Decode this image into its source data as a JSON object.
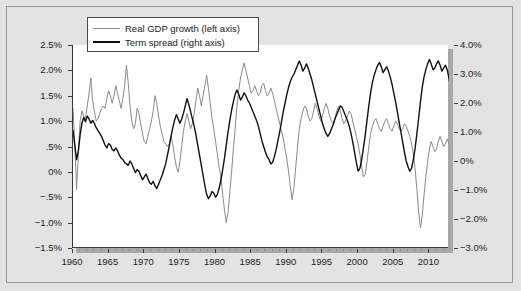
{
  "chart_data": {
    "type": "line",
    "title": "",
    "subtitle": "",
    "xlabel": "",
    "ylabel": "",
    "grid": false,
    "legend_position": "top-left",
    "x_axis": {
      "min": 1960,
      "max": 2012.75,
      "major_ticks": [
        1960,
        1965,
        1970,
        1975,
        1980,
        1985,
        1990,
        1995,
        2000,
        2005,
        2010
      ],
      "tick_labels": [
        "1960",
        "1965",
        "1970",
        "1975",
        "1980",
        "1985",
        "1990",
        "1995",
        "2000",
        "2005",
        "2010"
      ],
      "minor_tick_interval": 1
    },
    "y_axis_left": {
      "label": "Real GDP growth",
      "min": -1.5,
      "max": 2.5,
      "ticks": [
        2.5,
        2.0,
        1.5,
        1.0,
        0.5,
        0.0,
        -0.5,
        -1.0,
        -1.5
      ],
      "tick_labels": [
        "2.5%",
        "2.0%",
        "1.5%",
        "1.0%",
        ".5%",
        "0%",
        "−.5%",
        "−1.0%",
        "−1.5%"
      ]
    },
    "y_axis_right": {
      "label": "Term spread",
      "min": -3.0,
      "max": 4.0,
      "ticks": [
        4.0,
        3.0,
        2.0,
        1.0,
        0.0,
        -1.0,
        -2.0,
        -3.0
      ],
      "tick_labels": [
        "4.0%",
        "3.0%",
        "2.0%",
        "1.0%",
        "0%",
        "−1.0%",
        "−2.0%",
        "−3.0%"
      ]
    },
    "series": [
      {
        "name": "Real GDP growth (left axis)",
        "axis": "left",
        "color": "#8a8a8a",
        "width": 1,
        "x_start": 1960.0,
        "x_step": 0.25,
        "values": [
          1.25,
          0.55,
          -0.35,
          0.35,
          1.0,
          1.2,
          1.1,
          1.05,
          1.3,
          1.55,
          1.85,
          1.4,
          1.2,
          1.0,
          1.05,
          1.15,
          1.25,
          1.3,
          1.25,
          1.45,
          1.6,
          1.5,
          1.35,
          1.5,
          1.7,
          1.55,
          1.4,
          1.25,
          1.45,
          1.7,
          2.1,
          1.75,
          1.3,
          1.0,
          0.85,
          0.95,
          1.25,
          1.15,
          0.95,
          0.75,
          0.6,
          0.55,
          0.7,
          0.85,
          1.0,
          1.2,
          1.5,
          1.35,
          1.1,
          0.9,
          0.75,
          0.6,
          0.55,
          0.5,
          0.55,
          0.7,
          0.55,
          0.3,
          0.1,
          0.0,
          0.2,
          0.5,
          0.8,
          1.0,
          1.15,
          1.0,
          0.85,
          0.95,
          1.15,
          1.4,
          1.65,
          1.5,
          1.3,
          1.5,
          1.7,
          1.9,
          1.65,
          1.35,
          1.05,
          0.85,
          0.6,
          0.35,
          0.1,
          -0.1,
          -0.45,
          -0.75,
          -1.0,
          -0.8,
          -0.4,
          0.0,
          0.45,
          0.85,
          1.3,
          1.6,
          1.85,
          2.0,
          2.15,
          2.0,
          1.85,
          1.7,
          1.55,
          1.6,
          1.7,
          1.6,
          1.5,
          1.55,
          1.7,
          1.75,
          1.6,
          1.5,
          1.55,
          1.65,
          1.55,
          1.4,
          1.25,
          1.1,
          0.95,
          0.8,
          0.65,
          0.45,
          0.25,
          0.0,
          -0.3,
          -0.55,
          -0.3,
          0.1,
          0.5,
          0.85,
          1.05,
          1.2,
          1.3,
          1.25,
          1.1,
          1.0,
          1.05,
          1.2,
          1.35,
          1.25,
          1.1,
          1.0,
          1.1,
          1.25,
          1.35,
          1.25,
          1.1,
          1.0,
          0.95,
          1.05,
          1.2,
          1.3,
          1.2,
          1.05,
          0.95,
          1.0,
          1.1,
          1.2,
          1.15,
          1.0,
          0.85,
          0.7,
          0.55,
          0.35,
          0.1,
          -0.1,
          -0.05,
          0.2,
          0.5,
          0.75,
          0.9,
          1.0,
          1.05,
          0.95,
          0.85,
          0.8,
          0.9,
          1.0,
          1.05,
          0.95,
          0.85,
          0.8,
          0.9,
          1.0,
          0.95,
          0.85,
          0.8,
          0.85,
          0.95,
          0.9,
          0.8,
          0.7,
          0.55,
          0.35,
          0.05,
          -0.35,
          -0.8,
          -1.1,
          -0.85,
          -0.45,
          -0.1,
          0.2,
          0.45,
          0.6,
          0.5,
          0.4,
          0.45,
          0.6,
          0.7,
          0.6,
          0.5,
          0.55,
          0.65,
          0.55,
          0.45,
          0.5,
          0.55,
          0.5
        ]
      },
      {
        "name": "Term spread (right axis)",
        "axis": "right",
        "color": "#101010",
        "width": 1.4,
        "x_start": 1960.0,
        "x_step": 0.25,
        "values": [
          1.05,
          0.55,
          0.05,
          0.35,
          0.9,
          1.3,
          1.5,
          1.35,
          1.55,
          1.45,
          1.3,
          1.4,
          1.3,
          1.15,
          1.05,
          0.95,
          0.85,
          0.7,
          0.55,
          0.45,
          0.6,
          0.55,
          0.4,
          0.35,
          0.45,
          0.35,
          0.2,
          0.1,
          0.05,
          -0.05,
          -0.1,
          -0.15,
          0.0,
          -0.1,
          -0.25,
          -0.4,
          -0.3,
          -0.35,
          -0.5,
          -0.65,
          -0.55,
          -0.45,
          -0.6,
          -0.75,
          -0.8,
          -0.7,
          -0.85,
          -0.95,
          -0.8,
          -0.65,
          -0.5,
          -0.3,
          -0.1,
          0.2,
          0.5,
          0.85,
          1.15,
          1.4,
          1.6,
          1.45,
          1.3,
          1.45,
          1.65,
          1.9,
          2.15,
          1.95,
          1.7,
          1.45,
          1.2,
          0.9,
          0.55,
          0.2,
          -0.15,
          -0.5,
          -0.85,
          -1.15,
          -1.3,
          -1.2,
          -1.05,
          -1.1,
          -1.25,
          -1.15,
          -0.95,
          -0.65,
          -0.3,
          0.1,
          0.55,
          1.0,
          1.4,
          1.75,
          2.05,
          2.3,
          2.45,
          2.3,
          2.1,
          2.2,
          2.35,
          2.25,
          2.1,
          2.0,
          1.85,
          1.7,
          1.55,
          1.4,
          1.2,
          0.95,
          0.7,
          0.5,
          0.3,
          0.15,
          0.05,
          -0.1,
          -0.05,
          0.15,
          0.4,
          0.7,
          1.0,
          1.35,
          1.7,
          2.0,
          2.3,
          2.55,
          2.75,
          2.9,
          3.0,
          3.15,
          3.3,
          3.45,
          3.3,
          3.1,
          3.2,
          3.35,
          3.2,
          3.0,
          2.8,
          2.55,
          2.3,
          2.05,
          1.8,
          1.55,
          1.3,
          1.1,
          0.95,
          0.85,
          0.95,
          1.1,
          1.25,
          1.45,
          1.6,
          1.75,
          1.9,
          1.85,
          1.7,
          1.55,
          1.4,
          1.2,
          0.95,
          0.65,
          0.3,
          -0.05,
          -0.35,
          -0.25,
          0.05,
          0.45,
          0.9,
          1.4,
          1.9,
          2.35,
          2.7,
          2.95,
          3.15,
          3.3,
          3.4,
          3.25,
          3.05,
          3.15,
          3.25,
          3.1,
          2.9,
          2.65,
          2.35,
          2.05,
          1.7,
          1.35,
          1.0,
          0.65,
          0.3,
          0.0,
          -0.2,
          -0.35,
          -0.25,
          0.05,
          0.45,
          0.95,
          1.5,
          2.05,
          2.55,
          2.9,
          3.15,
          3.35,
          3.5,
          3.35,
          3.15,
          3.2,
          3.35,
          3.45,
          3.3,
          3.1,
          3.2,
          3.3,
          3.15,
          2.85,
          2.5,
          2.15,
          2.0
        ]
      }
    ]
  },
  "legend": {
    "entries": [
      {
        "label": "Real GDP growth (left axis)",
        "style": "thin"
      },
      {
        "label": "Term spread (right axis)",
        "style": "thick"
      }
    ]
  }
}
